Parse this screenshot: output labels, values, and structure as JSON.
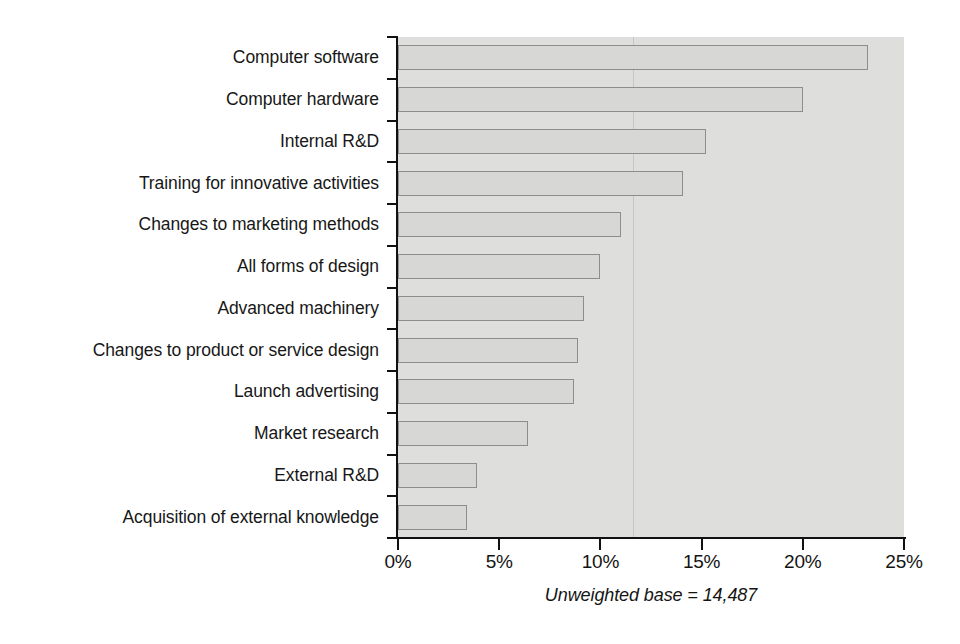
{
  "chart_data": {
    "type": "bar",
    "orientation": "horizontal",
    "title": "",
    "subtitle": "",
    "xlabel": "",
    "ylabel": "",
    "xlim": [
      0,
      25
    ],
    "ylim": null,
    "grid": false,
    "legend": null,
    "x_tick_labels": [
      "0%",
      "5%",
      "10%",
      "15%",
      "20%",
      "25%"
    ],
    "x_tick_values": [
      0,
      5,
      10,
      15,
      20,
      25
    ],
    "categories": [
      "Computer software",
      "Computer hardware",
      "Internal R&D",
      "Training for innovative activities",
      "Changes to marketing methods",
      "All forms of design",
      "Advanced machinery",
      "Changes to product or service design",
      "Launch advertising",
      "Market research",
      "External R&D",
      "Acquisition of external knowledge"
    ],
    "values": [
      23.2,
      20.0,
      15.2,
      14.1,
      11.0,
      10.0,
      9.2,
      8.9,
      8.7,
      6.4,
      3.9,
      3.4
    ],
    "value_unit": "%",
    "annotations": [
      "Unweighted base = 14,487"
    ],
    "colors": {
      "bar_fill": "#d7d7d5",
      "bar_edge": "#8d8d8d",
      "plot_background": "#dededc",
      "axis": "#111111",
      "text": "#171717"
    }
  },
  "caption": {
    "text": "Unweighted base = 14,487"
  }
}
